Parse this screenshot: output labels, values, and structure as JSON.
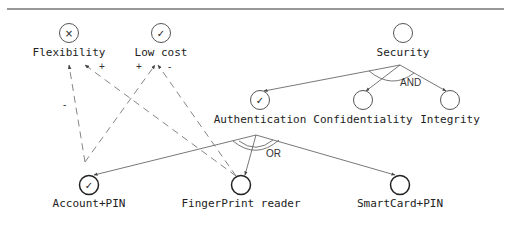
{
  "diagram": {
    "type": "goal-model",
    "softgoals": [
      {
        "id": "flexibility",
        "label": "Flexibility",
        "status": "denied",
        "mark": "×"
      },
      {
        "id": "lowcost",
        "label": "Low cost",
        "status": "satisfied",
        "mark": "✓"
      }
    ],
    "goals": [
      {
        "id": "security",
        "label": "Security",
        "status": "",
        "mark": ""
      },
      {
        "id": "authentication",
        "label": "Authentication",
        "status": "satisfied",
        "mark": "✓"
      },
      {
        "id": "confidentiality",
        "label": "Confidentiality",
        "status": "",
        "mark": ""
      },
      {
        "id": "integrity",
        "label": "Integrity",
        "status": "",
        "mark": ""
      }
    ],
    "alternatives": [
      {
        "id": "accountpin",
        "label": "Account+PIN",
        "status": "satisfied",
        "mark": "✓"
      },
      {
        "id": "fingerprint",
        "label": "FingerPrint reader",
        "status": "",
        "mark": ""
      },
      {
        "id": "smartcard",
        "label": "SmartCard+PIN",
        "status": "",
        "mark": ""
      }
    ],
    "decompositions": [
      {
        "parent": "Security",
        "type": "AND",
        "children": [
          "Authentication",
          "Confidentiality",
          "Integrity"
        ]
      },
      {
        "parent": "Authentication",
        "type": "OR",
        "children": [
          "Account+PIN",
          "FingerPrint reader",
          "SmartCard+PIN"
        ]
      }
    ],
    "contributions": [
      {
        "from": "Account+PIN",
        "to": "Flexibility",
        "sign": "-"
      },
      {
        "from": "Account+PIN",
        "to": "Low cost",
        "sign": "+"
      },
      {
        "from": "FingerPrint reader",
        "to": "Flexibility",
        "sign": "+"
      },
      {
        "from": "FingerPrint reader",
        "to": "Low cost",
        "sign": "-"
      }
    ],
    "labels": {
      "and": "AND",
      "or": "OR",
      "plus": "+",
      "minus": "-"
    }
  }
}
